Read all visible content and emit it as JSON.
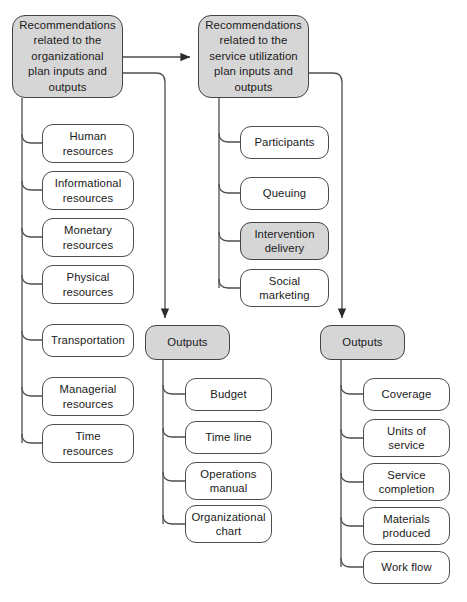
{
  "diagram": {
    "colors": {
      "shaded_fill": "#d6d6d6",
      "plain_fill": "#ffffff",
      "stroke": "#4d4d4d",
      "text": "#1a1a1a",
      "background": "#ffffff"
    },
    "roots": [
      {
        "id": "root-organizational",
        "label": "Recommendations\nrelated to the\norganizational\nplan inputs and\noutputs",
        "shaded": true,
        "x": 12,
        "y": 15,
        "w": 111,
        "h": 83
      },
      {
        "id": "root-service-utilization",
        "label": "Recommendations\nrelated to the\nservice utilization\nplan inputs and\noutputs",
        "shaded": true,
        "x": 198,
        "y": 15,
        "w": 111,
        "h": 83
      }
    ],
    "outputs_nodes": [
      {
        "id": "outputs-organizational",
        "label": "Outputs",
        "shaded": true,
        "x": 145,
        "y": 325,
        "w": 85,
        "h": 35
      },
      {
        "id": "outputs-service",
        "label": "Outputs",
        "shaded": true,
        "x": 320,
        "y": 325,
        "w": 85,
        "h": 35
      }
    ],
    "branches": [
      {
        "id": "organizational-inputs",
        "parent": "root-organizational",
        "spine_x": 22,
        "items": [
          {
            "label": "Human\nresources",
            "shaded": false,
            "x": 42,
            "y": 124,
            "w": 92,
            "h": 39
          },
          {
            "label": "Informational\nresources",
            "shaded": false,
            "x": 42,
            "y": 171,
            "w": 92,
            "h": 39
          },
          {
            "label": "Monetary\nresources",
            "shaded": false,
            "x": 42,
            "y": 218,
            "w": 92,
            "h": 39
          },
          {
            "label": "Physical\nresources",
            "shaded": false,
            "x": 42,
            "y": 265,
            "w": 92,
            "h": 39
          },
          {
            "label": "Transportation",
            "shaded": false,
            "x": 42,
            "y": 324,
            "w": 92,
            "h": 33
          },
          {
            "label": "Managerial\nresources",
            "shaded": false,
            "x": 42,
            "y": 377,
            "w": 92,
            "h": 39
          },
          {
            "label": "Time\nresources",
            "shaded": false,
            "x": 42,
            "y": 424,
            "w": 92,
            "h": 39
          }
        ]
      },
      {
        "id": "service-utilization-inputs",
        "parent": "root-service-utilization",
        "spine_x": 219,
        "items": [
          {
            "label": "Participants",
            "shaded": false,
            "x": 240,
            "y": 126,
            "w": 89,
            "h": 33
          },
          {
            "label": "Queuing",
            "shaded": false,
            "x": 240,
            "y": 177,
            "w": 89,
            "h": 33
          },
          {
            "label": "Intervention\ndelivery",
            "shaded": true,
            "x": 240,
            "y": 222,
            "w": 89,
            "h": 38
          },
          {
            "label": "Social\nmarketing",
            "shaded": false,
            "x": 240,
            "y": 269,
            "w": 89,
            "h": 38
          }
        ]
      },
      {
        "id": "organizational-outputs",
        "parent": "outputs-organizational",
        "spine_x": 163,
        "items": [
          {
            "label": "Budget",
            "shaded": false,
            "x": 185,
            "y": 378,
            "w": 87,
            "h": 33
          },
          {
            "label": "Time line",
            "shaded": false,
            "x": 185,
            "y": 421,
            "w": 87,
            "h": 33
          },
          {
            "label": "Operations\nmanual",
            "shaded": false,
            "x": 185,
            "y": 462,
            "w": 87,
            "h": 38
          },
          {
            "label": "Organizational\nchart",
            "shaded": false,
            "x": 185,
            "y": 505,
            "w": 87,
            "h": 38
          }
        ]
      },
      {
        "id": "service-outputs",
        "parent": "outputs-service",
        "spine_x": 341,
        "items": [
          {
            "label": "Coverage",
            "shaded": false,
            "x": 363,
            "y": 378,
            "w": 87,
            "h": 33
          },
          {
            "label": "Units of\nservice",
            "shaded": false,
            "x": 363,
            "y": 419,
            "w": 87,
            "h": 38
          },
          {
            "label": "Service\ncompletion",
            "shaded": false,
            "x": 363,
            "y": 463,
            "w": 87,
            "h": 38
          },
          {
            "label": "Materials\nproduced",
            "shaded": false,
            "x": 363,
            "y": 507,
            "w": 87,
            "h": 38
          },
          {
            "label": "Work flow",
            "shaded": false,
            "x": 363,
            "y": 551,
            "w": 87,
            "h": 33
          }
        ]
      }
    ],
    "connectors": [
      {
        "id": "root-to-root-arrow",
        "type": "arrow",
        "from": "root-organizational",
        "to": "root-service-utilization"
      },
      {
        "id": "organizational-to-outputs",
        "type": "arrow",
        "from": "root-organizational",
        "to": "outputs-organizational"
      },
      {
        "id": "service-to-outputs",
        "type": "arrow",
        "from": "root-service-utilization",
        "to": "outputs-service"
      }
    ]
  }
}
